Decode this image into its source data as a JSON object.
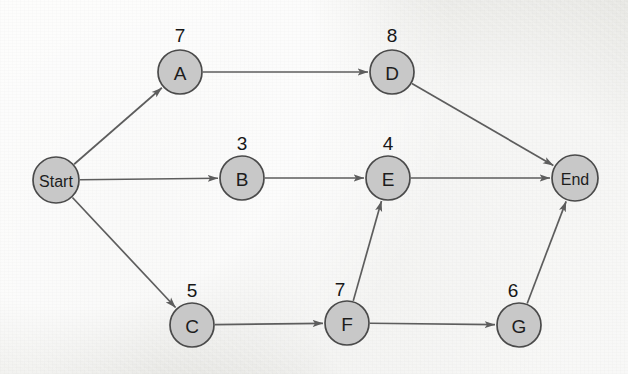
{
  "diagram": {
    "type": "weighted-directed-graph",
    "title": "",
    "canvas": {
      "width": 628,
      "height": 374
    },
    "style": {
      "background_color": "#efefec",
      "node_fill": "#c8c8c8",
      "node_stroke": "#4a4a4a",
      "edge_color": "#5d5d5d",
      "label_color": "#1d1d1d",
      "weight_color": "#171717"
    },
    "nodes": [
      {
        "id": "start",
        "label": "Start",
        "cx": 56,
        "cy": 180,
        "r": 23,
        "terminal": true,
        "weight": null,
        "weight_x": null,
        "weight_y": null
      },
      {
        "id": "a",
        "label": "A",
        "cx": 180,
        "cy": 72,
        "r": 22,
        "terminal": false,
        "weight": "7",
        "weight_x": 180,
        "weight_y": 35
      },
      {
        "id": "b",
        "label": "B",
        "cx": 242,
        "cy": 178,
        "r": 22,
        "terminal": false,
        "weight": "3",
        "weight_x": 242,
        "weight_y": 143
      },
      {
        "id": "c",
        "label": "C",
        "cx": 192,
        "cy": 325,
        "r": 22,
        "terminal": false,
        "weight": "5",
        "weight_x": 192,
        "weight_y": 290
      },
      {
        "id": "d",
        "label": "D",
        "cx": 392,
        "cy": 72,
        "r": 22,
        "terminal": false,
        "weight": "8",
        "weight_x": 392,
        "weight_y": 35
      },
      {
        "id": "e",
        "label": "E",
        "cx": 388,
        "cy": 178,
        "r": 22,
        "terminal": false,
        "weight": "4",
        "weight_x": 388,
        "weight_y": 143
      },
      {
        "id": "f",
        "label": "F",
        "cx": 347,
        "cy": 323,
        "r": 22,
        "terminal": false,
        "weight": "7",
        "weight_x": 340,
        "weight_y": 289
      },
      {
        "id": "g",
        "label": "G",
        "cx": 519,
        "cy": 325,
        "r": 22,
        "terminal": false,
        "weight": "6",
        "weight_x": 513,
        "weight_y": 290
      },
      {
        "id": "end",
        "label": "End",
        "cx": 575,
        "cy": 178,
        "r": 23,
        "terminal": true,
        "weight": null,
        "weight_x": null,
        "weight_y": null
      }
    ],
    "edges": [
      {
        "id": "start-a",
        "from": "start",
        "to": "a",
        "directed": true
      },
      {
        "id": "start-b",
        "from": "start",
        "to": "b",
        "directed": true
      },
      {
        "id": "start-c",
        "from": "start",
        "to": "c",
        "directed": true
      },
      {
        "id": "a-d",
        "from": "a",
        "to": "d",
        "directed": true
      },
      {
        "id": "b-e",
        "from": "b",
        "to": "e",
        "directed": true
      },
      {
        "id": "c-f",
        "from": "c",
        "to": "f",
        "directed": true
      },
      {
        "id": "d-end",
        "from": "d",
        "to": "end",
        "directed": true
      },
      {
        "id": "e-end",
        "from": "e",
        "to": "end",
        "directed": true
      },
      {
        "id": "f-e",
        "from": "f",
        "to": "e",
        "directed": true
      },
      {
        "id": "f-g",
        "from": "f",
        "to": "g",
        "directed": true
      },
      {
        "id": "g-end",
        "from": "g",
        "to": "end",
        "directed": true
      }
    ]
  }
}
